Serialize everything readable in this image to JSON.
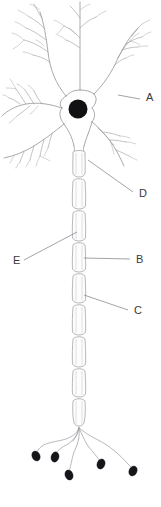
{
  "figure": {
    "type": "biological-diagram",
    "background_color": "#ffffff",
    "width": 161,
    "height": 507
  },
  "labels": [
    {
      "id": "A",
      "text": "A",
      "x": 146,
      "y": 101,
      "leader_from": [
        118,
        95
      ],
      "leader_to": [
        140,
        99
      ],
      "target": "dendrite"
    },
    {
      "id": "D",
      "text": "D",
      "x": 139,
      "y": 197,
      "leader_from": [
        88,
        160
      ],
      "leader_to": [
        133,
        192
      ],
      "target": "axon-hillock"
    },
    {
      "id": "E",
      "text": "E",
      "x": 13,
      "y": 264,
      "leader_from": [
        77,
        232
      ],
      "leader_to": [
        24,
        260
      ],
      "target": "myelin-sheath"
    },
    {
      "id": "B",
      "text": "B",
      "x": 136,
      "y": 263,
      "leader_from": [
        84,
        258
      ],
      "leader_to": [
        130,
        259
      ],
      "target": "node-of-ranvier"
    },
    {
      "id": "C",
      "text": "C",
      "x": 134,
      "y": 314,
      "leader_from": [
        84,
        295
      ],
      "leader_to": [
        128,
        310
      ],
      "target": "axon-segment"
    }
  ],
  "colors": {
    "outline": "#9a9aa0",
    "nucleus": "#111114",
    "bouton": "#16161a",
    "leader": "#7c7c82",
    "label_text": "#3a3a3a",
    "background": "#ffffff"
  },
  "parts": {
    "nucleus": {
      "cx": 78,
      "cy": 109,
      "r": 9.5
    },
    "soma": {
      "cx": 78,
      "cy": 105
    },
    "axon": {
      "x": 79,
      "top": 150,
      "bottom": 428,
      "width": 13
    },
    "nodes_of_ranvier_y": [
      176,
      208,
      240,
      271,
      302,
      334,
      366,
      396,
      426
    ],
    "dendrite_count": 6,
    "bouton_count": 5,
    "boutons": [
      {
        "cx": 36,
        "cy": 456,
        "rx": 4.0,
        "ry": 5.2,
        "rot": -25
      },
      {
        "cx": 55,
        "cy": 457,
        "rx": 4.0,
        "ry": 5.2,
        "rot": 15
      },
      {
        "cx": 69,
        "cy": 475,
        "rx": 4.0,
        "ry": 5.2,
        "rot": -20
      },
      {
        "cx": 101,
        "cy": 464,
        "rx": 4.0,
        "ry": 5.2,
        "rot": 20
      },
      {
        "cx": 133,
        "cy": 471,
        "rx": 4.0,
        "ry": 5.2,
        "rot": 25
      }
    ]
  }
}
